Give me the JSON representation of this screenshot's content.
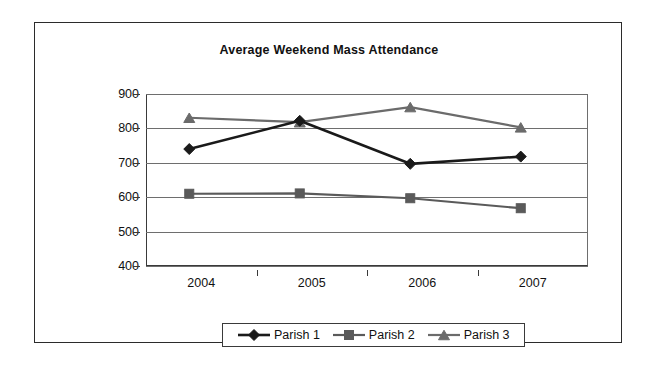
{
  "chart_data": {
    "type": "line",
    "title": "Average Weekend Mass Attendance",
    "xlabel": "",
    "ylabel": "",
    "categories": [
      "2004",
      "2005",
      "2006",
      "2007"
    ],
    "ylim": [
      400,
      900
    ],
    "yticks": [
      400,
      500,
      600,
      700,
      800,
      900
    ],
    "ytick_labels": [
      "400",
      "500",
      "600",
      "700",
      "800",
      "900"
    ],
    "grid": true,
    "legend_position": "bottom",
    "series": [
      {
        "name": "Parish 1",
        "marker": "diamond",
        "color": "#1a1a1a",
        "values": [
          740,
          822,
          697,
          718
        ]
      },
      {
        "name": "Parish 2",
        "marker": "square",
        "color": "#5a5a5a",
        "values": [
          610,
          611,
          597,
          568
        ]
      },
      {
        "name": "Parish 3",
        "marker": "triangle",
        "color": "#6b6b6b",
        "values": [
          831,
          818,
          862,
          803
        ]
      }
    ]
  },
  "legend": {
    "items": [
      {
        "label": "Parish 1"
      },
      {
        "label": "Parish 2"
      },
      {
        "label": "Parish 3"
      }
    ]
  },
  "colors": {
    "frame": "#2b2b2b",
    "grid": "#6e6e6e",
    "axis": "#3a3a3a",
    "series1": "#1a1a1a",
    "series2": "#5a5a5a",
    "series3": "#6b6b6b",
    "background": "#ffffff",
    "text": "#111111"
  }
}
